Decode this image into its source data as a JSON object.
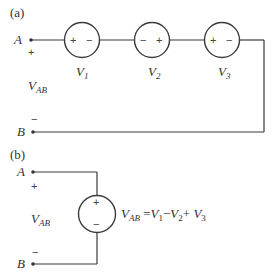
{
  "diagram": {
    "part_a": {
      "label": "(a)",
      "node_top": "A",
      "node_bottom": "B",
      "plus": "+",
      "minus": "−",
      "voltage_label": {
        "main": "V",
        "sub": "AB"
      },
      "sources": [
        {
          "name": "V",
          "sub": "1",
          "left_sign": "+",
          "right_sign": "−"
        },
        {
          "name": "V",
          "sub": "2",
          "left_sign": "−",
          "right_sign": "+"
        },
        {
          "name": "V",
          "sub": "3",
          "left_sign": "+",
          "right_sign": "−"
        }
      ]
    },
    "part_b": {
      "label": "(b)",
      "node_top": "A",
      "node_bottom": "B",
      "plus": "+",
      "minus": "−",
      "voltage_label": {
        "main": "V",
        "sub": "AB"
      },
      "source": {
        "top_sign": "+",
        "bottom_sign": "−"
      },
      "equation": {
        "lhs_main": "V",
        "lhs_sub": "AB",
        "eq": " =",
        "t1_main": "V",
        "t1_sub": "1",
        "op1": "−",
        "t2_main": "V",
        "t2_sub": "2",
        "op2": "+ ",
        "t3_main": "V",
        "t3_sub": "3"
      }
    }
  }
}
